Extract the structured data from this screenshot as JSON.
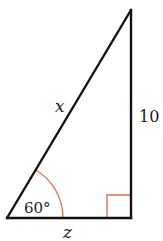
{
  "diagram": {
    "type": "right-triangle",
    "vertices": {
      "bottom_left": [
        7,
        218
      ],
      "bottom_right": [
        131,
        218
      ],
      "top": [
        131,
        10
      ]
    },
    "labels": {
      "hypotenuse": "x",
      "vertical_leg": "10",
      "horizontal_leg": "z",
      "angle": "60°"
    },
    "right_angle_marker": true,
    "colors": {
      "edges": "#111111",
      "angle_marks": "#e06a4a",
      "text": "#1a1a1a",
      "background": "#ffffff"
    }
  }
}
